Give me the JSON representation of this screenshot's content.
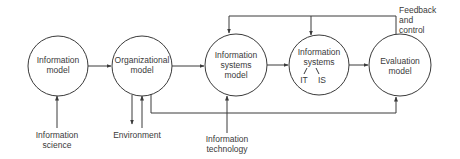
{
  "diagram": {
    "nodes": [
      {
        "id": "information-model",
        "line1": "Information",
        "line2": "model",
        "line3": ""
      },
      {
        "id": "organizational-model",
        "line1": "Organizational",
        "line2": "model",
        "line3": ""
      },
      {
        "id": "information-systems-model",
        "line1": "Information",
        "line2": "systems",
        "line3": "model"
      },
      {
        "id": "information-systems",
        "line1": "Information",
        "line2": "systems",
        "sub_left": "IT",
        "sub_right": "IS"
      },
      {
        "id": "evaluation-model",
        "line1": "Evaluation",
        "line2": "model",
        "line3": ""
      }
    ],
    "inputs": {
      "information_science": {
        "line1": "Information",
        "line2": "science"
      },
      "environment": {
        "line1": "Environment"
      },
      "information_technology": {
        "line1": "Information",
        "line2": "technology"
      }
    },
    "feedback": {
      "line1": "Feedback",
      "line2": "and",
      "line3": "control"
    },
    "colors": {
      "line": "#3a3a3a",
      "background": "#ffffff"
    }
  }
}
